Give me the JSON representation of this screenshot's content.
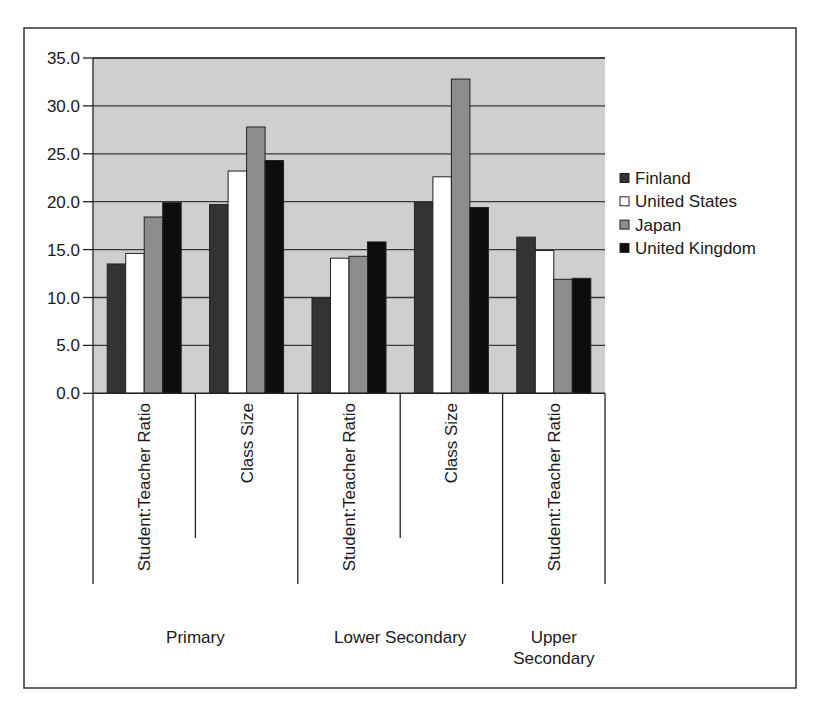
{
  "chart_data": {
    "type": "bar",
    "title": "",
    "xlabel": "",
    "ylabel": "",
    "ylim": [
      0,
      35
    ],
    "y_ticks": [
      "0.0",
      "5.0",
      "10.0",
      "15.0",
      "20.0",
      "25.0",
      "30.0",
      "35.0"
    ],
    "y_tick_values": [
      0,
      5,
      10,
      15,
      20,
      25,
      30,
      35
    ],
    "grid": true,
    "legend_position": "right",
    "categories": [
      "Student:Teacher Ratio",
      "Class Size",
      "Student:Teacher Ratio",
      "Class Size",
      "Student:Teacher Ratio"
    ],
    "category_groups": [
      {
        "label": "Primary",
        "span": [
          0,
          1
        ]
      },
      {
        "label": "Lower Secondary",
        "span": [
          2,
          3
        ]
      },
      {
        "label": "Upper\nSecondary",
        "span": [
          4,
          4
        ]
      }
    ],
    "series": [
      {
        "name": "Finland",
        "color": "#333333",
        "values": [
          13.5,
          19.7,
          9.9,
          19.9,
          16.3
        ]
      },
      {
        "name": "United States",
        "color": "#ffffff",
        "values": [
          14.6,
          23.2,
          14.1,
          22.6,
          14.9
        ]
      },
      {
        "name": "Japan",
        "color": "#8c8c8c",
        "values": [
          18.4,
          27.8,
          14.3,
          32.8,
          11.9
        ]
      },
      {
        "name": "United Kingdom",
        "color": "#0d0d0d",
        "values": [
          19.9,
          24.3,
          15.8,
          19.4,
          12.0
        ]
      }
    ],
    "plot_background": "#cfcfcf"
  }
}
